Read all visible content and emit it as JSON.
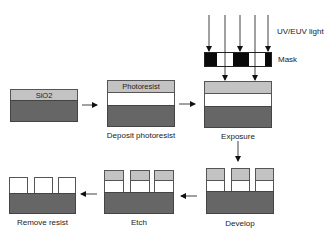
{
  "diagram": {
    "steps": [
      {
        "id": "sio2",
        "inner_label": "SiO2",
        "caption": ""
      },
      {
        "id": "deposit",
        "inner_label": "Photoresist",
        "caption": "Deposit photoresist"
      },
      {
        "id": "exposure",
        "inner_label": "",
        "caption": "Exposure"
      },
      {
        "id": "develop",
        "inner_label": "",
        "caption": "Develop"
      },
      {
        "id": "etch",
        "inner_label": "",
        "caption": "Etch"
      },
      {
        "id": "remove",
        "inner_label": "",
        "caption": "Remove resist"
      }
    ],
    "light_label": "UV/EUV light",
    "mask_label": "Mask",
    "colors": {
      "resist": "#c3c3c3",
      "oxide": "#ffffff",
      "substrate": "#666666",
      "mask_opaque": "#0a0a0a"
    }
  }
}
